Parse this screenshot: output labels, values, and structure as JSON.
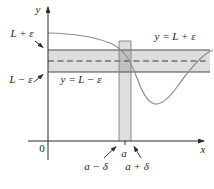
{
  "figure": {
    "labels": {
      "y_axis": "y",
      "x_axis": "x",
      "origin": "0",
      "l_plus_eps": "L + ε",
      "l_minus_eps": "L − ε",
      "line_top": "y = L + ε",
      "line_bottom": "y = L − ε",
      "a": "a",
      "a_minus_delta": "a − δ",
      "a_plus_delta": "a + δ"
    },
    "colors": {
      "background": "#ffffff",
      "band_fill": "rgba(0,0,0,0.13)",
      "band_edge": "#4a4a4a",
      "strip_edge": "#8a8a8a",
      "dashed_line": "#3a3a3a",
      "curve": "#8c8c8c",
      "axis": "#2b2b2b",
      "text": "#1f1f1f"
    }
  }
}
